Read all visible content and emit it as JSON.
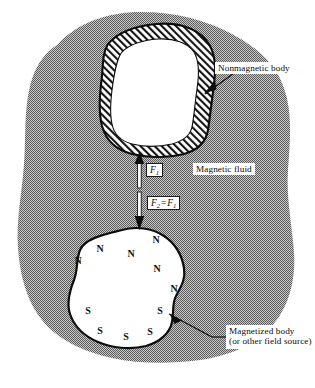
{
  "figure": {
    "background_color": "#ffffff",
    "fluid_color": "#9a9a9a",
    "outline_color": "#111111",
    "body_fill_color": "#ffffff"
  },
  "labels": {
    "nonmagnetic_body": "Nonmagnetic body",
    "magnetic_fluid": "Magnetic fluid",
    "magnetized_body_line1": "Magnetized body",
    "magnetized_body_line2": "(or other field source)"
  },
  "forces": [
    {
      "id": "f1",
      "symbol": "F",
      "subscript": "1",
      "full_text": "F1",
      "direction": "up"
    },
    {
      "id": "f2",
      "symbol": "F",
      "subscript": "2",
      "relation": "=",
      "full_text": "F2 = F1",
      "direction": "down"
    }
  ],
  "poles": {
    "north_label": "N",
    "south_label": "S",
    "north": [
      {
        "label": "N",
        "x": 78,
        "y": 260
      },
      {
        "label": "N",
        "x": 100,
        "y": 248
      },
      {
        "label": "N",
        "x": 131,
        "y": 253
      },
      {
        "label": "N",
        "x": 157,
        "y": 268
      },
      {
        "label": "N",
        "x": 174,
        "y": 288
      },
      {
        "label": "N",
        "x": 156,
        "y": 239
      }
    ],
    "south": [
      {
        "label": "S",
        "x": 88,
        "y": 310
      },
      {
        "label": "S",
        "x": 100,
        "y": 330
      },
      {
        "label": "S",
        "x": 126,
        "y": 336
      },
      {
        "label": "S",
        "x": 150,
        "y": 331
      },
      {
        "label": "S",
        "x": 160,
        "y": 310
      }
    ]
  },
  "shapes": {
    "fluid_blob": "M 58 44 C 78 22 110 12 140 12 C 176 12 206 20 232 34 C 258 48 276 64 284 88 C 293 114 290 142 288 170 C 286 198 292 224 294 252 C 296 282 288 308 272 326 C 254 346 228 356 200 360 C 170 364 140 364 112 358 C 84 352 58 340 42 320 C 26 300 20 274 18 248 C 16 220 22 192 24 164 C 26 136 24 110 30 86 C 36 64 44 54 58 44 Z",
    "nonmagnetic_outer": "M 108 44 C 118 32 136 26 156 24 C 178 22 196 28 206 40 C 216 52 216 68 214 84 C 212 100 210 116 208 130 C 206 142 198 150 184 154 C 168 158 148 158 132 154 C 116 150 106 140 102 126 C 98 110 100 92 102 76 C 103 62 103 52 108 44 Z",
    "nonmagnetic_inner": "M 122 52 C 130 44 144 40 158 39 C 174 38 188 43 194 52 C 200 62 199 76 197 89 C 195 103 194 117 192 127 C 190 136 183 141 172 144 C 159 147 144 147 132 144 C 121 141 114 134 112 124 C 109 111 111 96 113 83 C 115 70 117 58 122 52 Z",
    "magnetized_body": "M 122 230 C 136 226 152 228 164 236 C 176 244 182 256 184 268 C 186 280 180 288 176 296 C 172 303 174 312 172 322 C 170 333 160 342 146 346 C 130 350 112 348 98 342 C 84 336 74 326 70 314 C 66 302 70 290 74 280 C 78 270 76 260 80 250 C 85 238 106 234 122 230 Z"
  },
  "leaders": {
    "nonmagnetic_tip": {
      "x": 205,
      "y": 94
    },
    "nonmagnetic_elbow": {
      "x": 237,
      "y": 71
    },
    "magnetized_tip": {
      "x": 169,
      "y": 314
    },
    "magnetized_elbow": {
      "x": 212,
      "y": 337
    }
  }
}
